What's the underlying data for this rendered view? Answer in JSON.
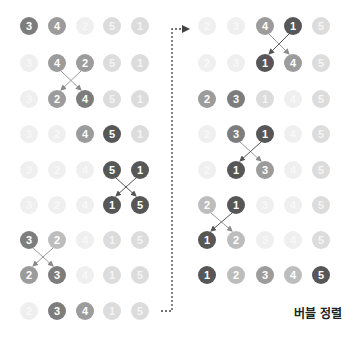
{
  "title": "버블 정렬",
  "colors": {
    "s1": "#575757",
    "s2": "#7d7d7d",
    "s3": "#9c9c9c",
    "s4": "#bdbdbd",
    "s5": "#dcdcdc",
    "s6": "#efefef",
    "arrow": "#8a8a8a",
    "connector": "#444444"
  },
  "left_panel": {
    "columns_x": [
      29,
      57,
      85,
      112,
      140
    ],
    "rows": [
      {
        "y": 26,
        "cells": [
          {
            "v": "3",
            "s": "s2"
          },
          {
            "v": "4",
            "s": "s3"
          },
          {
            "v": "2",
            "s": "s6"
          },
          {
            "v": "5",
            "s": "s5"
          },
          {
            "v": "1",
            "s": "s5"
          }
        ]
      },
      {
        "y": 63,
        "cells": [
          {
            "v": "3",
            "s": "s6"
          },
          {
            "v": "4",
            "s": "s3"
          },
          {
            "v": "2",
            "s": "s3"
          },
          {
            "v": "5",
            "s": "s5"
          },
          {
            "v": "1",
            "s": "s5"
          }
        ]
      },
      {
        "y": 99,
        "cells": [
          {
            "v": "3",
            "s": "s6"
          },
          {
            "v": "2",
            "s": "s3"
          },
          {
            "v": "4",
            "s": "s2"
          },
          {
            "v": "5",
            "s": "s5"
          },
          {
            "v": "1",
            "s": "s5"
          }
        ]
      },
      {
        "y": 134,
        "cells": [
          {
            "v": "3",
            "s": "s6"
          },
          {
            "v": "2",
            "s": "s6"
          },
          {
            "v": "4",
            "s": "s3"
          },
          {
            "v": "5",
            "s": "s1"
          },
          {
            "v": "1",
            "s": "s5"
          }
        ]
      },
      {
        "y": 170,
        "cells": [
          {
            "v": "3",
            "s": "s6"
          },
          {
            "v": "2",
            "s": "s6"
          },
          {
            "v": "4",
            "s": "s6"
          },
          {
            "v": "5",
            "s": "s1"
          },
          {
            "v": "1",
            "s": "s1"
          }
        ]
      },
      {
        "y": 205,
        "cells": [
          {
            "v": "3",
            "s": "s6"
          },
          {
            "v": "2",
            "s": "s6"
          },
          {
            "v": "4",
            "s": "s6"
          },
          {
            "v": "1",
            "s": "s1"
          },
          {
            "v": "5",
            "s": "s1"
          }
        ]
      },
      {
        "y": 240,
        "cells": [
          {
            "v": "3",
            "s": "s2"
          },
          {
            "v": "2",
            "s": "s4"
          },
          {
            "v": "4",
            "s": "s6"
          },
          {
            "v": "1",
            "s": "s5"
          },
          {
            "v": "5",
            "s": "s5"
          }
        ]
      },
      {
        "y": 275,
        "cells": [
          {
            "v": "2",
            "s": "s3"
          },
          {
            "v": "3",
            "s": "s2"
          },
          {
            "v": "4",
            "s": "s6"
          },
          {
            "v": "1",
            "s": "s5"
          },
          {
            "v": "5",
            "s": "s5"
          }
        ]
      },
      {
        "y": 311,
        "cells": [
          {
            "v": "2",
            "s": "s6"
          },
          {
            "v": "3",
            "s": "s2"
          },
          {
            "v": "4",
            "s": "s3"
          },
          {
            "v": "1",
            "s": "s5"
          },
          {
            "v": "5",
            "s": "s5"
          }
        ]
      }
    ],
    "swaps": [
      {
        "from_row": 1,
        "cols": [
          1,
          2
        ]
      },
      {
        "from_row": 4,
        "cols": [
          3,
          4
        ]
      },
      {
        "from_row": 6,
        "cols": [
          0,
          1
        ]
      }
    ]
  },
  "right_panel": {
    "columns_x": [
      207,
      236,
      265,
      293,
      321
    ],
    "rows": [
      {
        "y": 26,
        "cells": [
          {
            "v": "2",
            "s": "s6"
          },
          {
            "v": "3",
            "s": "s6"
          },
          {
            "v": "4",
            "s": "s3"
          },
          {
            "v": "1",
            "s": "s1"
          },
          {
            "v": "5",
            "s": "s5"
          }
        ]
      },
      {
        "y": 63,
        "cells": [
          {
            "v": "2",
            "s": "s6"
          },
          {
            "v": "3",
            "s": "s6"
          },
          {
            "v": "1",
            "s": "s1"
          },
          {
            "v": "4",
            "s": "s3"
          },
          {
            "v": "5",
            "s": "s5"
          }
        ]
      },
      {
        "y": 99,
        "cells": [
          {
            "v": "2",
            "s": "s3"
          },
          {
            "v": "3",
            "s": "s2"
          },
          {
            "v": "1",
            "s": "s5"
          },
          {
            "v": "4",
            "s": "s6"
          },
          {
            "v": "5",
            "s": "s5"
          }
        ]
      },
      {
        "y": 134,
        "cells": [
          {
            "v": "2",
            "s": "s6"
          },
          {
            "v": "3",
            "s": "s2"
          },
          {
            "v": "1",
            "s": "s1"
          },
          {
            "v": "4",
            "s": "s6"
          },
          {
            "v": "5",
            "s": "s5"
          }
        ]
      },
      {
        "y": 170,
        "cells": [
          {
            "v": "2",
            "s": "s6"
          },
          {
            "v": "1",
            "s": "s1"
          },
          {
            "v": "3",
            "s": "s3"
          },
          {
            "v": "4",
            "s": "s6"
          },
          {
            "v": "5",
            "s": "s5"
          }
        ]
      },
      {
        "y": 205,
        "cells": [
          {
            "v": "2",
            "s": "s4"
          },
          {
            "v": "1",
            "s": "s1"
          },
          {
            "v": "3",
            "s": "s6"
          },
          {
            "v": "4",
            "s": "s6"
          },
          {
            "v": "5",
            "s": "s5"
          }
        ]
      },
      {
        "y": 240,
        "cells": [
          {
            "v": "1",
            "s": "s1"
          },
          {
            "v": "2",
            "s": "s4"
          },
          {
            "v": "3",
            "s": "s6"
          },
          {
            "v": "4",
            "s": "s6"
          },
          {
            "v": "5",
            "s": "s5"
          }
        ]
      },
      {
        "y": 275,
        "cells": [
          {
            "v": "1",
            "s": "s1"
          },
          {
            "v": "2",
            "s": "s4"
          },
          {
            "v": "3",
            "s": "s3"
          },
          {
            "v": "4",
            "s": "s4"
          },
          {
            "v": "5",
            "s": "s1"
          }
        ]
      }
    ],
    "swaps": [
      {
        "from_row": 0,
        "cols": [
          2,
          3
        ]
      },
      {
        "from_row": 3,
        "cols": [
          1,
          2
        ]
      },
      {
        "from_row": 5,
        "cols": [
          0,
          1
        ]
      }
    ]
  },
  "connector": {
    "x": 172,
    "top_y": 29,
    "bottom_y": 311,
    "left_x": 161,
    "arrow_x": 188
  }
}
